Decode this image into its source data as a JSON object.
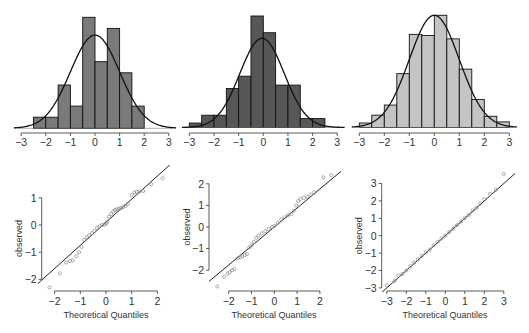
{
  "figure": {
    "width": 529,
    "height": 333,
    "background": "#ffffff"
  },
  "chart_data": [
    {
      "type": "bar",
      "panel": "histogram-1",
      "title": "",
      "xlabel": "",
      "ylabel": "",
      "xlim": [
        -3,
        3
      ],
      "xticks": [
        -3,
        -2,
        -1,
        0,
        1,
        2,
        3
      ],
      "bin_width": 0.5,
      "bin_edges": [
        -2.5,
        -2.0,
        -1.5,
        -1.0,
        -0.5,
        0.0,
        0.5,
        1.0,
        1.5,
        2.0
      ],
      "relative_heights": [
        0.1,
        0.1,
        0.39,
        0.2,
        1.0,
        0.6,
        0.9,
        0.5,
        0.2
      ],
      "fill_color": "#7a7a7a",
      "overlay": {
        "type": "normal_curve",
        "mean": 0.0,
        "sd": 1.0,
        "peak_relative": 0.84
      },
      "grid": false
    },
    {
      "type": "bar",
      "panel": "histogram-2",
      "title": "",
      "xlabel": "",
      "ylabel": "",
      "xlim": [
        -3,
        3
      ],
      "xticks": [
        -3,
        -2,
        -1,
        0,
        1,
        2,
        3
      ],
      "bin_width": 0.5,
      "bin_edges": [
        -3.0,
        -2.5,
        -2.0,
        -1.5,
        -1.0,
        -0.5,
        0.0,
        0.5,
        1.0,
        1.5,
        2.0,
        2.5
      ],
      "relative_heights": [
        0.04,
        0.11,
        0.11,
        0.35,
        0.46,
        1.0,
        0.85,
        0.38,
        0.38,
        0.08,
        0.08
      ],
      "fill_color": "#575757",
      "overlay": {
        "type": "normal_curve",
        "mean": -0.05,
        "sd": 0.9,
        "peak_relative": 0.8
      },
      "grid": false
    },
    {
      "type": "bar",
      "panel": "histogram-3",
      "title": "",
      "xlabel": "",
      "ylabel": "",
      "xlim": [
        -3,
        3
      ],
      "xticks": [
        -3,
        -2,
        -1,
        0,
        1,
        2,
        3
      ],
      "bin_width": 0.5,
      "bin_edges": [
        -3.0,
        -2.5,
        -2.0,
        -1.5,
        -1.0,
        -0.5,
        0.0,
        0.5,
        1.0,
        1.5,
        2.0,
        2.5,
        3.0
      ],
      "relative_heights": [
        0.04,
        0.11,
        0.2,
        0.48,
        0.83,
        0.82,
        1.0,
        0.79,
        0.52,
        0.25,
        0.1,
        0.05
      ],
      "fill_color": "#c4c4c4",
      "overlay": {
        "type": "normal_curve",
        "mean": 0.0,
        "sd": 1.0,
        "peak_relative": 1.0
      },
      "grid": false
    },
    {
      "type": "scatter",
      "panel": "qqplot-1",
      "title": "",
      "xlabel": "Theoretical Quantiles",
      "ylabel": "observed",
      "xlim": [
        -2.3,
        2.3
      ],
      "ylim": [
        -2.2,
        1.3
      ],
      "xticks": [
        -2,
        -1,
        0,
        1,
        2
      ],
      "yticks": [
        -2,
        -1,
        0,
        1
      ],
      "x": [
        -2.2,
        -1.8,
        -1.55,
        -1.4,
        -1.3,
        -1.15,
        -1.05,
        -0.95,
        -0.85,
        -0.75,
        -0.65,
        -0.55,
        -0.45,
        -0.35,
        -0.25,
        -0.15,
        -0.05,
        0.0,
        0.05,
        0.12,
        0.2,
        0.28,
        0.35,
        0.42,
        0.5,
        0.58,
        0.65,
        0.75,
        0.85,
        1.0,
        1.1,
        1.2,
        1.3,
        1.45,
        1.75,
        2.2
      ],
      "y": [
        -2.3,
        -1.78,
        -1.38,
        -1.33,
        -1.3,
        -1.15,
        -1.0,
        -0.8,
        -0.55,
        -0.45,
        -0.38,
        -0.3,
        -0.22,
        -0.1,
        -0.05,
        0.0,
        0.02,
        0.05,
        0.12,
        0.3,
        0.4,
        0.5,
        0.55,
        0.58,
        0.6,
        0.62,
        0.65,
        0.7,
        0.78,
        1.1,
        1.2,
        1.22,
        1.23,
        1.25,
        1.5,
        1.72
      ],
      "reference_line": {
        "intercept": 0.1,
        "slope": 0.85
      },
      "marker": "open-circle",
      "grid": false
    },
    {
      "type": "scatter",
      "panel": "qqplot-2",
      "title": "",
      "xlabel": "Theoretical Quantiles",
      "ylabel": "observed",
      "xlim": [
        -2.6,
        2.6
      ],
      "ylim": [
        -2.6,
        2.6
      ],
      "xticks": [
        -2,
        -1,
        0,
        1,
        2
      ],
      "yticks": [
        -2,
        -1,
        0,
        1,
        2
      ],
      "x": [
        -2.5,
        -2.2,
        -2.05,
        -1.95,
        -1.85,
        -1.75,
        -1.6,
        -1.5,
        -1.4,
        -1.3,
        -1.2,
        -1.1,
        -1.0,
        -0.9,
        -0.8,
        -0.7,
        -0.55,
        -0.4,
        -0.25,
        -0.1,
        0.0,
        0.15,
        0.3,
        0.45,
        0.6,
        0.75,
        0.85,
        0.95,
        1.05,
        1.15,
        1.3,
        1.45,
        1.6,
        1.75,
        2.15,
        2.5
      ],
      "y": [
        -2.75,
        -2.3,
        -2.15,
        -2.1,
        -2.0,
        -1.95,
        -1.45,
        -1.4,
        -1.35,
        -1.3,
        -1.25,
        -0.95,
        -0.85,
        -0.7,
        -0.5,
        -0.4,
        -0.3,
        -0.2,
        -0.1,
        0.0,
        0.05,
        0.2,
        0.35,
        0.45,
        0.55,
        0.6,
        0.75,
        1.0,
        1.2,
        1.3,
        1.35,
        1.4,
        1.5,
        1.6,
        2.3,
        2.4
      ],
      "reference_line": {
        "intercept": 0.0,
        "slope": 0.88
      },
      "marker": "open-circle",
      "grid": false
    },
    {
      "type": "scatter",
      "panel": "qqplot-3",
      "title": "",
      "xlabel": "Theoretical Quantiles",
      "ylabel": "observed",
      "xlim": [
        -3.1,
        3.1
      ],
      "ylim": [
        -3.1,
        3.5
      ],
      "xticks": [
        -3,
        -2,
        -1,
        0,
        1,
        2,
        3
      ],
      "yticks": [
        -3,
        -2,
        -1,
        0,
        1,
        2,
        3
      ],
      "x": [
        -3.0,
        -2.6,
        -2.4,
        -2.2,
        -2.0,
        -1.8,
        -1.6,
        -1.4,
        -1.2,
        -1.0,
        -0.8,
        -0.6,
        -0.4,
        -0.2,
        0.0,
        0.2,
        0.4,
        0.6,
        0.8,
        1.0,
        1.2,
        1.4,
        1.6,
        1.8,
        2.0,
        2.3,
        2.6,
        3.0
      ],
      "y": [
        -2.85,
        -2.6,
        -2.3,
        -2.2,
        -2.0,
        -1.75,
        -1.55,
        -1.35,
        -1.15,
        -0.95,
        -0.8,
        -0.55,
        -0.35,
        -0.15,
        0.0,
        0.2,
        0.4,
        0.6,
        0.8,
        1.0,
        1.2,
        1.45,
        1.6,
        1.85,
        2.1,
        2.4,
        2.65,
        3.55
      ],
      "reference_line": {
        "intercept": 0.0,
        "slope": 1.0
      },
      "marker": "open-circle",
      "grid": false
    }
  ],
  "layout": {
    "hist_panels": [
      {
        "x0": 95.0,
        "px_per_unit": 24.6,
        "baseline": 128.3,
        "max_bar_top": 17.3,
        "axis_y": 133,
        "tick_label_y": 146
      },
      {
        "x0": 263.3,
        "px_per_unit": 24.65,
        "baseline": 127.5,
        "max_bar_top": 16.0,
        "axis_y": 133,
        "tick_label_y": 146
      },
      {
        "x0": 434.3,
        "px_per_unit": 25.0,
        "baseline": 127.5,
        "max_bar_top": 15.3,
        "axis_y": 133,
        "tick_label_y": 146
      }
    ],
    "qq_panels": [
      {
        "x0": 106.0,
        "xpx": 25.7,
        "y0": 225.0,
        "ypx": 27.2,
        "yaxis_x": 41.7,
        "xaxis_y": 291,
        "xlabel_x": 106,
        "ylabel_x": 22,
        "clip": [
          38,
          165,
          170,
          292
        ]
      },
      {
        "x0": 274.3,
        "xpx": 22.8,
        "y0": 227.0,
        "ypx": 21.6,
        "yaxis_x": 209.0,
        "xaxis_y": 291,
        "xlabel_x": 274,
        "ylabel_x": 190,
        "clip": [
          209,
          165,
          341,
          292
        ]
      },
      {
        "x0": 445.3,
        "xpx": 19.5,
        "y0": 235.7,
        "ypx": 17.4,
        "yaxis_x": 381.7,
        "xaxis_y": 291,
        "xlabel_x": 445,
        "ylabel_x": 362,
        "clip": [
          382,
          165,
          515,
          292
        ]
      }
    ]
  }
}
